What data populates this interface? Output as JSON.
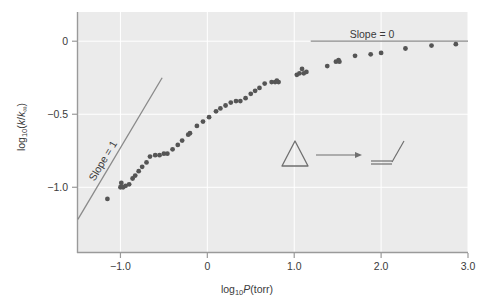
{
  "figure": {
    "background_color": "#ffffff",
    "plot_background_color": "#ebebeb",
    "grid_color": "#ffffff",
    "marker_color": "#555555",
    "line_color": "#8a8a8a",
    "axis_color": "#9a9a9a",
    "text_color": "#3a3a3a"
  },
  "axis": {
    "x_label_main": "log",
    "x_label_sub": "10",
    "x_label_var": "P",
    "x_label_unit": "(torr)",
    "y_label_main": "log",
    "y_label_sub": "10",
    "y_label_open": "(",
    "y_label_k": "k",
    "y_label_slash": "/",
    "y_label_kinf": "k",
    "y_label_inf": "∞",
    "y_label_close": ")"
  },
  "annotations": {
    "slope_one": "Slope = 1",
    "slope_zero": "Slope = 0"
  },
  "inset": {
    "reactant_name": "cyclopropane-triangle",
    "arrow_name": "reaction-arrow",
    "product_name": "propene-structure"
  },
  "chart_data": {
    "type": "scatter",
    "title": "",
    "xlabel": "log10 P (torr)",
    "ylabel": "log10 (k / k_inf)",
    "xlim": [
      -1.5,
      3.0
    ],
    "ylim": [
      -1.45,
      0.2
    ],
    "grid": true,
    "legend": null,
    "xticks": [
      -1.0,
      0,
      1.0,
      2.0,
      3.0
    ],
    "xticklabels": [
      "−1.0",
      "0",
      "1.0",
      "2.0",
      "3.0"
    ],
    "yticks": [
      0,
      -0.5,
      -1.0
    ],
    "yticklabels": [
      "0",
      "−0.5",
      "−1.0"
    ],
    "series": [
      {
        "name": "falloff data",
        "marker": "circle",
        "color": "#555555",
        "points": [
          [
            -1.15,
            -1.08
          ],
          [
            -1.0,
            -1.0
          ],
          [
            -0.99,
            -0.97
          ],
          [
            -0.97,
            -1.0
          ],
          [
            -0.94,
            -0.99
          ],
          [
            -0.9,
            -0.98
          ],
          [
            -0.86,
            -0.94
          ],
          [
            -0.83,
            -0.92
          ],
          [
            -0.79,
            -0.89
          ],
          [
            -0.75,
            -0.86
          ],
          [
            -0.7,
            -0.83
          ],
          [
            -0.66,
            -0.79
          ],
          [
            -0.6,
            -0.78
          ],
          [
            -0.55,
            -0.78
          ],
          [
            -0.5,
            -0.77
          ],
          [
            -0.46,
            -0.77
          ],
          [
            -0.4,
            -0.74
          ],
          [
            -0.34,
            -0.71
          ],
          [
            -0.29,
            -0.68
          ],
          [
            -0.22,
            -0.64
          ],
          [
            -0.2,
            -0.63
          ],
          [
            -0.12,
            -0.58
          ],
          [
            -0.05,
            -0.55
          ],
          [
            0.02,
            -0.52
          ],
          [
            0.1,
            -0.48
          ],
          [
            0.15,
            -0.46
          ],
          [
            0.21,
            -0.44
          ],
          [
            0.27,
            -0.42
          ],
          [
            0.33,
            -0.41
          ],
          [
            0.38,
            -0.41
          ],
          [
            0.44,
            -0.39
          ],
          [
            0.5,
            -0.36
          ],
          [
            0.55,
            -0.34
          ],
          [
            0.6,
            -0.32
          ],
          [
            0.66,
            -0.29
          ],
          [
            0.74,
            -0.28
          ],
          [
            0.78,
            -0.28
          ],
          [
            0.8,
            -0.27
          ],
          [
            0.82,
            -0.28
          ],
          [
            1.03,
            -0.23
          ],
          [
            1.06,
            -0.22
          ],
          [
            1.09,
            -0.19
          ],
          [
            1.11,
            -0.22
          ],
          [
            1.14,
            -0.21
          ],
          [
            1.38,
            -0.17
          ],
          [
            1.48,
            -0.14
          ],
          [
            1.51,
            -0.13
          ],
          [
            1.52,
            -0.14
          ],
          [
            1.7,
            -0.1
          ],
          [
            1.88,
            -0.09
          ],
          [
            2.0,
            -0.08
          ],
          [
            2.28,
            -0.05
          ],
          [
            2.58,
            -0.03
          ],
          [
            2.86,
            -0.02
          ]
        ]
      }
    ],
    "reference_lines": [
      {
        "name": "slope-1-line",
        "label": "Slope = 1",
        "slope": 1,
        "x_start": -1.49,
        "y_start": -1.22,
        "x_end": -0.52,
        "y_end": -0.25,
        "color": "#8a8a8a"
      },
      {
        "name": "slope-0-line",
        "label": "Slope = 0",
        "slope": 0,
        "x_start": 1.19,
        "y_start": 0.0,
        "x_end": 3.0,
        "y_end": 0.0,
        "color": "#8a8a8a"
      }
    ]
  }
}
